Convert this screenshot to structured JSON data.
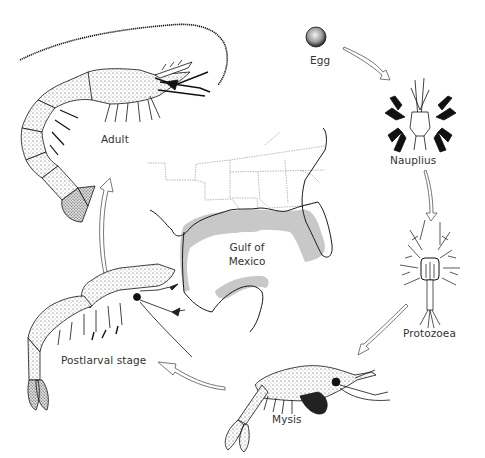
{
  "diagram": {
    "type": "life-cycle",
    "stages": [
      {
        "id": "egg",
        "label": "Egg"
      },
      {
        "id": "nauplius",
        "label": "Nauplius"
      },
      {
        "id": "protozoea",
        "label": "Protozoea"
      },
      {
        "id": "mysis",
        "label": "Mysis"
      },
      {
        "id": "postlarval",
        "label": "Postlarval stage"
      },
      {
        "id": "adult",
        "label": "Adult"
      }
    ],
    "flow": [
      "Egg",
      "Nauplius",
      "Protozoea",
      "Mysis",
      "Postlarval stage",
      "Adult"
    ],
    "map": {
      "label_line1": "Gulf of",
      "label_line2": "Mexico",
      "shaded_color": "#c8c8c8",
      "outline_color": "#222222"
    }
  },
  "colors": {
    "background": "#ffffff",
    "ink": "#1a1a1a",
    "text": "#333333",
    "shade": "#c8c8c8"
  }
}
